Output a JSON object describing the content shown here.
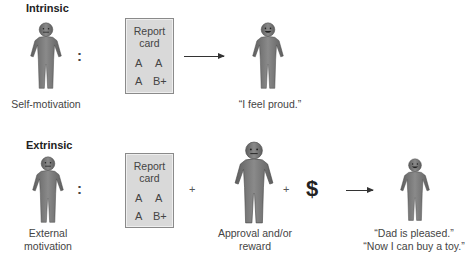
{
  "intrinsic": {
    "heading": "Intrinsic",
    "source_figure": {
      "caption": "Self-motivation",
      "expression": "neutral"
    },
    "separator": ":",
    "report_card": {
      "title_line1": "Report",
      "title_line2": "card",
      "grades": [
        "A",
        "A",
        "A",
        "B+"
      ]
    },
    "arrow": "right-arrow",
    "result_figure": {
      "caption": "“I feel proud.”",
      "expression": "happy"
    }
  },
  "extrinsic": {
    "heading": "Extrinsic",
    "source_figure": {
      "caption_line1": "External",
      "caption_line2": "motivation",
      "expression": "neutral"
    },
    "separator": ":",
    "report_card": {
      "title_line1": "Report",
      "title_line2": "card",
      "grades": [
        "A",
        "A",
        "A",
        "B+"
      ]
    },
    "plus1": "+",
    "approver_figure": {
      "caption_line1": "Approval and/or",
      "caption_line2": "reward",
      "expression": "neutral"
    },
    "plus2": "+",
    "money_symbol": "$",
    "arrow": "right-arrow",
    "result_figure": {
      "caption_line1": "“Dad is pleased.”",
      "caption_line2": "“Now I can buy a toy.”",
      "expression": "happy"
    }
  },
  "colors": {
    "figure_fill": "#7a7a7a",
    "figure_dark": "#555555",
    "card_fill": "#d9d9d9",
    "card_border": "#8a8a8a",
    "text": "#444444"
  }
}
